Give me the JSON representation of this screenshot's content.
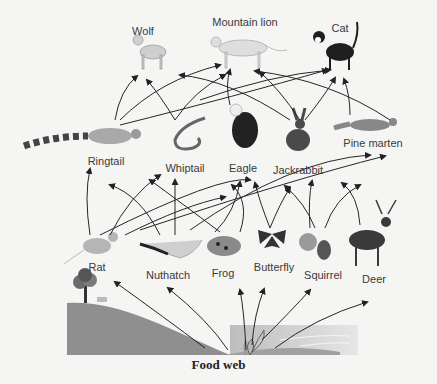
{
  "diagram": {
    "title": "Food web",
    "organisms": [
      {
        "id": "wolf",
        "label": "Wolf",
        "level": "top"
      },
      {
        "id": "mountain_lion",
        "label": "Mountain lion",
        "level": "top"
      },
      {
        "id": "cat",
        "label": "Cat",
        "level": "top"
      },
      {
        "id": "ringtail",
        "label": "Ringtail",
        "level": "middle"
      },
      {
        "id": "whiptail",
        "label": "Whiptail",
        "level": "middle"
      },
      {
        "id": "eagle",
        "label": "Eagle",
        "level": "middle"
      },
      {
        "id": "jackrabbit",
        "label": "Jackrabbit",
        "level": "middle"
      },
      {
        "id": "pine_marten",
        "label": "Pine marten",
        "level": "middle"
      },
      {
        "id": "rat",
        "label": "Rat",
        "level": "lower"
      },
      {
        "id": "nuthatch",
        "label": "Nuthatch",
        "level": "lower"
      },
      {
        "id": "frog",
        "label": "Frog",
        "level": "lower"
      },
      {
        "id": "butterfly",
        "label": "Butterfly",
        "level": "lower"
      },
      {
        "id": "squirrel",
        "label": "Squirrel",
        "level": "lower"
      },
      {
        "id": "deer",
        "label": "Deer",
        "level": "lower"
      }
    ],
    "producers": [
      "tree",
      "plants"
    ],
    "arrow_meaning": "energy flows from prey to predator",
    "colors": {
      "ground": "#8e8e8e",
      "water": "#d8d8d8",
      "arrow": "#2a2a2a",
      "background": "#f5f5f4"
    }
  }
}
